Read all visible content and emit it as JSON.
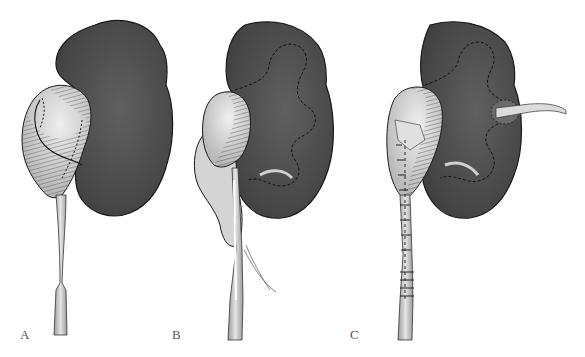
{
  "figure": {
    "colors": {
      "kidney_fill": "#4b4b4b",
      "kidney_highlight": "#5e5e5e",
      "kidney_outline": "#1a1a1a",
      "pelvis_fill": "#d8d8d8",
      "pelvis_highlight": "#ececec",
      "hatch": "#222222",
      "ureter_fill": "#cfcfcf",
      "dashed_line": "#1a1a1a",
      "calyx_light": "#c8c8c8",
      "tube_fill": "#dedede",
      "label": "#555555",
      "background": "#ffffff"
    },
    "panels": [
      {
        "label": "A",
        "caption": "Dilated renal pelvis with ureteropelvic junction marked for incision"
      },
      {
        "label": "B",
        "caption": "Pelvis and ureter opened with calyceal outline shown"
      },
      {
        "label": "C",
        "caption": "Anastomosis sutured with nephrostomy tube in place"
      }
    ]
  }
}
